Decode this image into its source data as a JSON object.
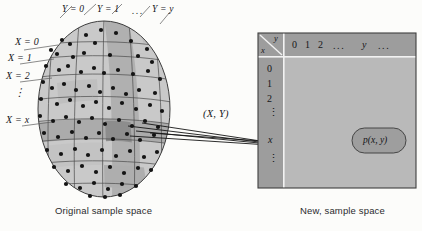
{
  "figure": {
    "left_panel": {
      "caption": "Original sample space",
      "column_labels": [
        {
          "id": "y0",
          "text": "Y = 0"
        },
        {
          "id": "y1",
          "text": "Y = 1"
        },
        {
          "id": "ydots",
          "text": "..."
        },
        {
          "id": "yy",
          "text": "Y = y"
        }
      ],
      "row_labels": [
        {
          "id": "x0",
          "text": "X = 0"
        },
        {
          "id": "x1",
          "text": "X = 1"
        },
        {
          "id": "x2",
          "text": "X = 2"
        },
        {
          "id": "xdots",
          "text": "⋮"
        },
        {
          "id": "xx",
          "text": "X = x"
        }
      ]
    },
    "mapping_label": "(X, Y)",
    "right_panel": {
      "caption": "New, sample space",
      "corner_row_var": "x",
      "corner_col_var": "y",
      "column_headers": [
        "0",
        "1",
        "2",
        "...",
        "y",
        "..."
      ],
      "row_headers": [
        "0",
        "1",
        "2",
        "⋮",
        "x",
        "⋮"
      ],
      "probability_label": "p(x, y)"
    },
    "colors": {
      "page_background": "#fcfcfa",
      "ellipse_light": "#c9c9c9",
      "ellipse_mid": "#b3b3b3",
      "ellipse_dark": "#9a9a9a",
      "ellipse_darkest": "#8a8a8a",
      "ellipse_outline": "#3a3a3a",
      "grid_line": "#4a4a4a",
      "dot_color": "#141414",
      "panel_body": "#b9b9b9",
      "panel_header": "#9d9d9d",
      "panel_border": "#3f3f3f",
      "panel_rule": "#f2f2f2",
      "ellipse_chip": "#9e9e9e",
      "arrow_color": "#151515",
      "text_color": "#16161a"
    }
  }
}
